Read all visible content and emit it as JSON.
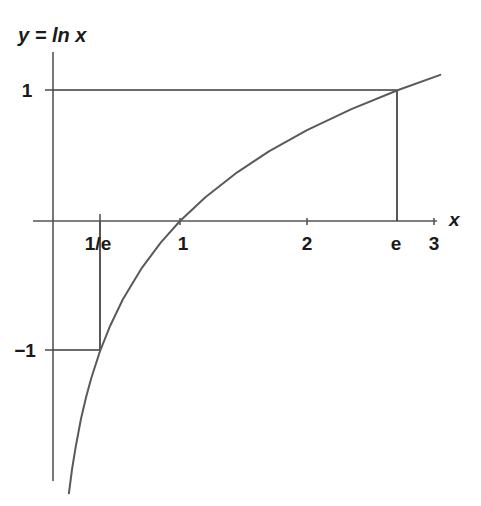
{
  "chart_data": {
    "type": "line",
    "title": "y = ln x",
    "xlabel": "x",
    "ylabel": "y",
    "function": "y = ln x",
    "xlim": [
      -0.05,
      3.05
    ],
    "ylim": [
      -2.1,
      1.25
    ],
    "grid": false,
    "legend": null,
    "x_ticks": [
      {
        "value": 0.3679,
        "label": "1/e"
      },
      {
        "value": 1,
        "label": "1"
      },
      {
        "value": 2,
        "label": "2"
      },
      {
        "value": 2.7183,
        "label": "e"
      },
      {
        "value": 3,
        "label": "3"
      }
    ],
    "y_ticks": [
      {
        "value": 1,
        "label": "1"
      },
      {
        "value": -1,
        "label": "−1"
      }
    ],
    "annotations": [
      {
        "name": "guide-e-to-one",
        "description": "horizontal guide at y = 1 from y-axis to x = e"
      },
      {
        "name": "guide-e-vertical",
        "description": "vertical guide at x = e from y = 1 down to x-axis"
      },
      {
        "name": "guide-inv-e-vertical",
        "description": "vertical guide at x = 1/e from x-axis down to y = -1"
      },
      {
        "name": "guide-inv-e-horizontal",
        "description": "horizontal guide at y = -1 from y-axis to x = 1/e"
      }
    ],
    "key_points": [
      {
        "x": 0.3679,
        "y": -1,
        "label": "(1/e, -1)"
      },
      {
        "x": 1,
        "y": 0,
        "label": "(1, 0)"
      },
      {
        "x": 2.7183,
        "y": 1,
        "label": "(e, 1)"
      }
    ],
    "series": [
      {
        "name": "ln x",
        "x": [
          0.125,
          0.15,
          0.18,
          0.22,
          0.26,
          0.3,
          0.3679,
          0.45,
          0.55,
          0.7,
          0.85,
          1.0,
          1.2,
          1.45,
          1.7,
          2.0,
          2.35,
          2.7183,
          3.05
        ],
        "y": [
          -2.079,
          -1.897,
          -1.715,
          -1.514,
          -1.347,
          -1.204,
          -1.0,
          -0.799,
          -0.598,
          -0.357,
          -0.163,
          0.0,
          0.182,
          0.372,
          0.531,
          0.693,
          0.854,
          1.0,
          1.115
        ]
      }
    ],
    "colors": {
      "background": "#ffffff",
      "curve": "#5a5a5a",
      "axis": "#555555",
      "guide": "#3a3a3a",
      "text": "#1a1a1a"
    }
  },
  "labels": {
    "function_label": "y = ln x",
    "x_axis_name": "x",
    "tick_y_one": "1",
    "tick_y_minus_one": "−1",
    "tick_x_inv_e": "1/e",
    "tick_x_one": "1",
    "tick_x_two": "2",
    "tick_x_e": "e",
    "tick_x_three": "3"
  }
}
